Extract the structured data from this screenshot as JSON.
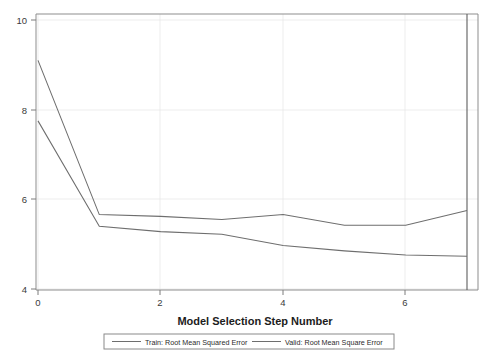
{
  "chart_data": {
    "type": "line",
    "title": "",
    "xlabel": "Model Selection Step Number",
    "ylabel": "",
    "xlim": [
      0,
      7.25
    ],
    "ylim": [
      3.8,
      10.15
    ],
    "xticks": [
      0,
      2,
      4,
      6
    ],
    "xtick_labels": [
      "0",
      "2",
      "4",
      "6"
    ],
    "yticks": [
      4,
      6,
      8,
      10
    ],
    "ytick_labels": [
      "4",
      "6",
      "8",
      "10"
    ],
    "grid": true,
    "legend_position": "bottom",
    "x": [
      0,
      1,
      2,
      3,
      4,
      5,
      6,
      7
    ],
    "series": [
      {
        "name": "Train: Root Mean Squared Error",
        "values": [
          7.75,
          5.4,
          5.28,
          5.22,
          4.97,
          4.85,
          4.76,
          4.73
        ]
      },
      {
        "name": "Valid: Root Mean Square Error",
        "values": [
          9.1,
          5.66,
          5.62,
          5.55,
          5.66,
          5.42,
          5.42,
          5.75
        ]
      }
    ],
    "selected_step_marker": 7,
    "annotations": []
  },
  "legend": {
    "entries": [
      {
        "label": "Train: Root Mean Squared Error"
      },
      {
        "label": "Valid: Root Mean Square Error"
      }
    ]
  },
  "axes": {
    "x_title": "Model Selection Step Number"
  },
  "ticks": {
    "y": [
      "10",
      "8",
      "6",
      "4"
    ],
    "x": [
      "0",
      "2",
      "4",
      "6"
    ]
  }
}
